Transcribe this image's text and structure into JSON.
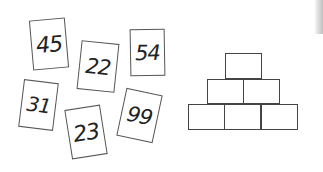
{
  "cards": [
    {
      "value": "45",
      "x": 31,
      "y": 19,
      "w": 36,
      "h": 50,
      "rot": -5,
      "fs": 22
    },
    {
      "value": "22",
      "x": 79,
      "y": 42,
      "w": 38,
      "h": 49,
      "rot": 6,
      "fs": 21
    },
    {
      "value": "54",
      "x": 130,
      "y": 29,
      "w": 35,
      "h": 47,
      "rot": -1,
      "fs": 21
    },
    {
      "value": "31",
      "x": 21,
      "y": 81,
      "w": 35,
      "h": 48,
      "rot": 7,
      "fs": 20
    },
    {
      "value": "23",
      "x": 68,
      "y": 107,
      "w": 36,
      "h": 50,
      "rot": -9,
      "fs": 22
    },
    {
      "value": "99",
      "x": 121,
      "y": 91,
      "w": 37,
      "h": 49,
      "rot": 12,
      "fs": 21
    }
  ],
  "pyramid": {
    "rows": [
      [
        {
          "x": 225,
          "y": 53,
          "w": 37,
          "h": 26
        }
      ],
      [
        {
          "x": 207,
          "y": 79,
          "w": 37,
          "h": 25
        },
        {
          "x": 243,
          "y": 79,
          "w": 37,
          "h": 25
        }
      ],
      [
        {
          "x": 188,
          "y": 104,
          "w": 37,
          "h": 26
        },
        {
          "x": 224,
          "y": 104,
          "w": 37,
          "h": 26
        },
        {
          "x": 261,
          "y": 104,
          "w": 37,
          "h": 26
        }
      ]
    ]
  }
}
